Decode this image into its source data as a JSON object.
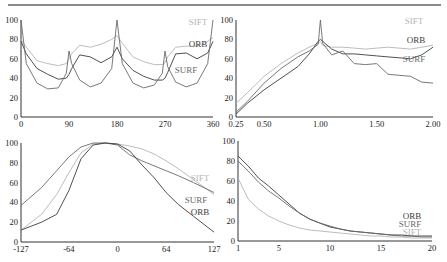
{
  "colors": {
    "SIFT": "#b4b4b4",
    "ORB": "#3c3c3c",
    "SURF": "#6a6a6a",
    "axis": "#333333"
  },
  "chart_data": [
    {
      "type": "line",
      "title": "",
      "xlabel": "Rotation (degrees)",
      "ylabel": "",
      "xlim": [
        0,
        360
      ],
      "ylim": [
        0,
        100
      ],
      "xticks": [
        "0",
        "90",
        "180",
        "270",
        "360"
      ],
      "yticks": [
        "0",
        "20",
        "40",
        "60",
        "80",
        "100"
      ],
      "grid": false,
      "legend": "inline labels at right",
      "x": [
        0,
        10,
        30,
        50,
        70,
        85,
        90,
        95,
        110,
        130,
        150,
        170,
        180,
        190,
        210,
        230,
        250,
        265,
        270,
        275,
        290,
        310,
        330,
        350,
        360
      ],
      "series": [
        {
          "name": "SIFT",
          "values": [
            80,
            72,
            58,
            55,
            53,
            55,
            60,
            65,
            74,
            72,
            75,
            80,
            84,
            76,
            62,
            57,
            54,
            54,
            56,
            62,
            72,
            73,
            73,
            78,
            82
          ]
        },
        {
          "name": "ORB",
          "values": [
            78,
            65,
            50,
            44,
            39,
            40,
            44,
            50,
            64,
            62,
            56,
            62,
            72,
            60,
            48,
            42,
            38,
            38,
            40,
            46,
            65,
            66,
            60,
            66,
            78
          ]
        },
        {
          "name": "SURF",
          "values": [
            100,
            55,
            35,
            29,
            30,
            45,
            68,
            55,
            38,
            31,
            35,
            50,
            100,
            55,
            35,
            30,
            33,
            45,
            68,
            52,
            36,
            31,
            35,
            55,
            100
          ]
        }
      ],
      "labels": [
        "SIFT",
        "ORB",
        "SURF"
      ]
    },
    {
      "type": "line",
      "title": "",
      "xlabel": "Scale",
      "ylabel": "",
      "xlim": [
        0.25,
        2.0
      ],
      "ylim": [
        0,
        100
      ],
      "xticks": [
        "0.25",
        "0.50",
        "1.00",
        "1.50",
        "2.00"
      ],
      "yticks": [
        "0",
        "20",
        "40",
        "60",
        "80",
        "100"
      ],
      "grid": false,
      "legend": "inline labels at right",
      "x": [
        0.25,
        0.35,
        0.5,
        0.65,
        0.8,
        0.9,
        0.98,
        1.0,
        1.02,
        1.1,
        1.2,
        1.3,
        1.4,
        1.5,
        1.6,
        1.7,
        1.8,
        1.9,
        2.0
      ],
      "series": [
        {
          "name": "SIFT",
          "values": [
            14,
            25,
            42,
            55,
            66,
            72,
            76,
            78,
            74,
            72,
            72,
            71,
            70,
            71,
            72,
            71,
            70,
            72,
            74
          ]
        },
        {
          "name": "ORB",
          "values": [
            3,
            14,
            28,
            40,
            52,
            65,
            78,
            80,
            78,
            70,
            65,
            65,
            64,
            63,
            62,
            61,
            60,
            64,
            72
          ]
        },
        {
          "name": "SURF",
          "values": [
            5,
            16,
            35,
            50,
            62,
            68,
            75,
            100,
            76,
            64,
            68,
            55,
            54,
            55,
            44,
            43,
            42,
            36,
            35
          ]
        }
      ],
      "labels": [
        "SIFT",
        "ORB",
        "SURF"
      ]
    },
    {
      "type": "line",
      "title": "",
      "xlabel": "Viewpoint",
      "ylabel": "",
      "xlim": [
        -127,
        127
      ],
      "ylim": [
        0,
        100
      ],
      "xticks": [
        "-127",
        "-64",
        "0",
        "64",
        "127"
      ],
      "yticks": [
        "0",
        "20",
        "40",
        "60",
        "80",
        "100"
      ],
      "grid": false,
      "legend": "inline labels at right",
      "x": [
        -127,
        -100,
        -80,
        -64,
        -48,
        -32,
        -16,
        0,
        16,
        32,
        48,
        64,
        80,
        100,
        127
      ],
      "series": [
        {
          "name": "SIFT",
          "values": [
            12,
            28,
            48,
            70,
            90,
            99,
            100,
            99,
            97,
            94,
            89,
            82,
            74,
            63,
            48
          ]
        },
        {
          "name": "SURF",
          "values": [
            37,
            55,
            72,
            86,
            96,
            100,
            100,
            98,
            88,
            82,
            77,
            72,
            67,
            60,
            50
          ]
        },
        {
          "name": "ORB",
          "values": [
            12,
            20,
            28,
            52,
            84,
            98,
            100,
            99,
            92,
            78,
            65,
            50,
            38,
            26,
            10
          ]
        }
      ],
      "labels": [
        "SIFT",
        "SURF",
        "ORB"
      ]
    },
    {
      "type": "line",
      "title": "",
      "xlabel": "",
      "ylabel": "",
      "xlim": [
        1,
        20
      ],
      "ylim": [
        0,
        100
      ],
      "xticks": [
        "1",
        "5",
        "10",
        "15",
        "20"
      ],
      "yticks": [
        "0",
        "20",
        "40",
        "60",
        "80",
        "100"
      ],
      "grid": false,
      "legend": "inline labels at right",
      "x": [
        1,
        2,
        3,
        4,
        5,
        6,
        7,
        8,
        9,
        10,
        11,
        12,
        13,
        14,
        15,
        16,
        17,
        18,
        19,
        20
      ],
      "series": [
        {
          "name": "ORB",
          "values": [
            85,
            75,
            63,
            55,
            46,
            37,
            28,
            22,
            18,
            14,
            12,
            10,
            9,
            8,
            7,
            6,
            6,
            5,
            5,
            5
          ]
        },
        {
          "name": "SURF",
          "values": [
            80,
            70,
            59,
            50,
            43,
            35,
            28,
            22,
            18,
            15,
            12,
            10,
            9,
            8,
            7,
            6,
            5,
            5,
            4,
            4
          ]
        },
        {
          "name": "SIFT",
          "values": [
            63,
            42,
            32,
            25,
            20,
            16,
            13,
            11,
            10,
            9,
            8,
            7,
            6,
            5,
            5,
            4,
            4,
            3,
            3,
            3
          ]
        }
      ],
      "labels": [
        "ORB",
        "SURF",
        "SIFT"
      ]
    }
  ]
}
